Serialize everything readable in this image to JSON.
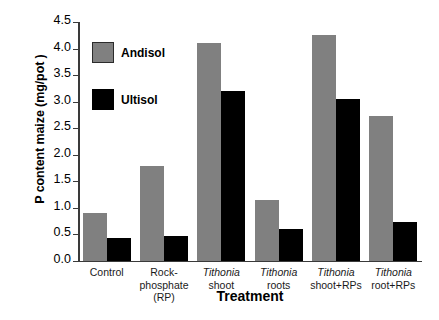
{
  "chart_data": {
    "type": "bar",
    "title": "",
    "xlabel": "Treatment",
    "ylabel": "P content maize (mg/pot )",
    "categories": [
      "Control",
      "Rock-phosphate (RP)",
      "Tithonia shoot",
      "Tithonia roots",
      "Tithonia shoot+RPs",
      "Tithonia root+RPs"
    ],
    "category_lines": [
      [
        "Control"
      ],
      [
        "Rock-",
        "phosphate (RP)"
      ],
      [
        "Tithonia",
        "shoot"
      ],
      [
        "Tithonia",
        "roots"
      ],
      [
        "Tithonia",
        "shoot+RPs"
      ],
      [
        "Tithonia",
        "root+RPs"
      ]
    ],
    "series": [
      {
        "name": "Andisol",
        "color": "#808080",
        "values": [
          0.9,
          1.79,
          4.1,
          1.15,
          4.26,
          2.72
        ]
      },
      {
        "name": "Ultisol",
        "color": "#000000",
        "values": [
          0.42,
          0.47,
          3.19,
          0.59,
          3.04,
          0.72
        ]
      }
    ],
    "ylim": [
      0.0,
      4.5
    ],
    "yticks": [
      "0.0",
      "0.5",
      "1.0",
      "1.5",
      "2.0",
      "2.5",
      "3.0",
      "3.5",
      "4.0",
      "4.5"
    ],
    "ytick_values": [
      0.0,
      0.5,
      1.0,
      1.5,
      2.0,
      2.5,
      3.0,
      3.5,
      4.0,
      4.5
    ],
    "grid": false,
    "legend_position": "upper-left-inside"
  },
  "legend": {
    "items": [
      {
        "label": "Andisol",
        "swatch": "gray-square-swatch"
      },
      {
        "label": "Ultisol",
        "swatch": "black-square-swatch"
      }
    ]
  },
  "axes": {
    "x_title": "Treatment",
    "y_title": "P content maize (mg/pot )"
  }
}
